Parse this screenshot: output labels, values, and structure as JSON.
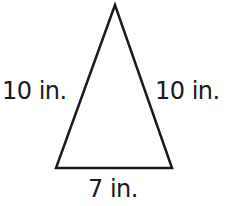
{
  "diagram": {
    "shape": "isosceles triangle",
    "stroke_color": "#1a1a1a",
    "fill_color": "#ffffff",
    "vertices": {
      "apex": [
        115,
        5
      ],
      "bottom_left": [
        56,
        168
      ],
      "bottom_right": [
        172,
        168
      ]
    },
    "labels": {
      "left_side": "10 in.",
      "right_side": "10 in.",
      "base": "7 in."
    }
  }
}
